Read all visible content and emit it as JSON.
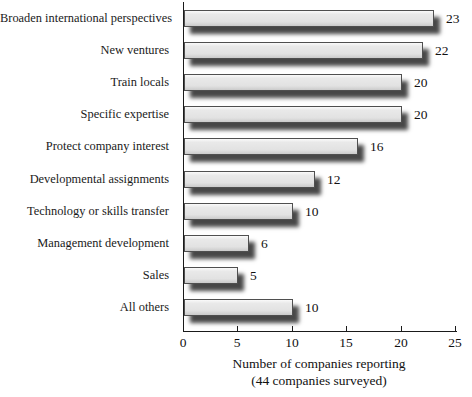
{
  "chart_data": {
    "type": "bar",
    "orientation": "horizontal",
    "title": "",
    "categories": [
      "Broaden international perspectives",
      "New ventures",
      "Train locals",
      "Specific expertise",
      "Protect company interest",
      "Developmental assignments",
      "Technology or skills transfer",
      "Management development",
      "Sales",
      "All others"
    ],
    "values": [
      23,
      22,
      20,
      20,
      16,
      12,
      10,
      6,
      5,
      10
    ],
    "value_labels": [
      "23",
      "22",
      "20",
      "20",
      "16",
      "12",
      "10",
      "6",
      "5",
      "10"
    ],
    "xlabel": "Number of companies reporting",
    "xlabel_note": "(44 companies surveyed)",
    "xlim": [
      0,
      25
    ],
    "xticks": [
      0,
      5,
      10,
      15,
      20,
      25
    ],
    "grid": false,
    "legend": "none",
    "colors": {
      "bar_fill": "#e2e2e2",
      "bar_border": "#4f4f4f",
      "bar_shadow": "rgba(0,0,0,0.72)",
      "axis": "#1a1a1a",
      "text": "#111111",
      "background": "#ffffff"
    }
  }
}
